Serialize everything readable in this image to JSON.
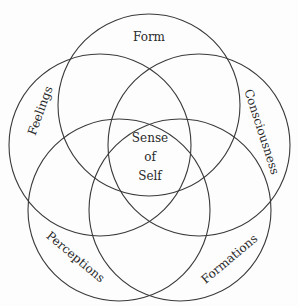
{
  "diagram": {
    "type": "five-circle venn",
    "center_label": [
      "Sense",
      "of",
      "Self"
    ],
    "circles": [
      {
        "label": "Form",
        "cx": 149,
        "cy": 105,
        "r": 91
      },
      {
        "label": "Feelings",
        "cx": 100,
        "cy": 145,
        "r": 91
      },
      {
        "label": "Consciousness",
        "cx": 199,
        "cy": 145,
        "r": 91
      },
      {
        "label": "Perceptions",
        "cx": 119,
        "cy": 210,
        "r": 91
      },
      {
        "label": "Formations",
        "cx": 180,
        "cy": 210,
        "r": 91
      }
    ],
    "stroke_color": "#3a3a3a",
    "background": "#fdfdfd"
  }
}
